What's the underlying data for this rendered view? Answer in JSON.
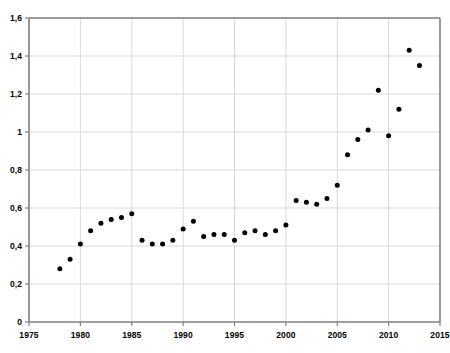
{
  "chart_data": {
    "type": "scatter",
    "title": "",
    "subtitle": "",
    "xlabel": "",
    "ylabel": "",
    "xlim": [
      1975,
      2015
    ],
    "ylim": [
      0,
      1.6
    ],
    "grid": true,
    "legend": null,
    "decimal_separator": ",",
    "marker": {
      "shape": "circle",
      "color": "#000000",
      "size_px": 5
    },
    "axis_color": "#808080",
    "grid_color": "#d9d9d9",
    "xticks": [
      1975,
      1980,
      1985,
      1990,
      1995,
      2000,
      2005,
      2010,
      2015
    ],
    "xtick_labels": [
      "1975",
      "1980",
      "1985",
      "1990",
      "1995",
      "2000",
      "2005",
      "2010",
      "2015"
    ],
    "yticks": [
      0,
      0.2,
      0.4,
      0.6,
      0.8,
      1.0,
      1.2,
      1.4,
      1.6
    ],
    "ytick_labels": [
      "0",
      "0,2",
      "0,4",
      "0,6",
      "0,8",
      "1",
      "1,2",
      "1,4",
      "1,6"
    ],
    "series": [
      {
        "name": "series-1",
        "x": [
          1978,
          1979,
          1980,
          1981,
          1982,
          1983,
          1984,
          1985,
          1986,
          1987,
          1988,
          1989,
          1990,
          1991,
          1992,
          1993,
          1994,
          1995,
          1996,
          1997,
          1998,
          1999,
          2000,
          2001,
          2002,
          2003,
          2004,
          2005,
          2006,
          2007,
          2008,
          2009,
          2010,
          2011,
          2012,
          2013
        ],
        "y": [
          0.28,
          0.33,
          0.41,
          0.48,
          0.52,
          0.54,
          0.55,
          0.57,
          0.43,
          0.41,
          0.41,
          0.43,
          0.49,
          0.53,
          0.45,
          0.46,
          0.46,
          0.43,
          0.47,
          0.48,
          0.46,
          0.48,
          0.51,
          0.64,
          0.63,
          0.62,
          0.65,
          0.72,
          0.88,
          0.96,
          1.01,
          1.22,
          0.98,
          1.12,
          1.43,
          1.35
        ]
      }
    ]
  }
}
